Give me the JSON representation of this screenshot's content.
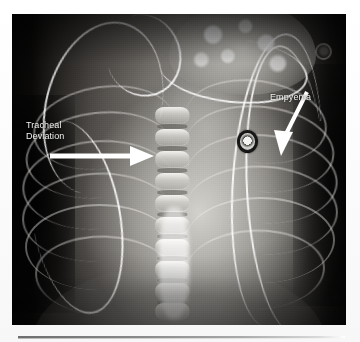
{
  "document": {
    "type": "scanned-figure-page",
    "background_color": "#fdfdfd"
  },
  "figure": {
    "name": "chest-radiograph",
    "modality": "X-ray",
    "view": "frontal chest / upper abdomen",
    "panel": {
      "x": 12,
      "y": 14,
      "width": 334,
      "height": 311
    },
    "background_color": "#0a0908"
  },
  "annotations": [
    {
      "id": "tracheal-deviation",
      "label": "Tracheal\nDeviation",
      "text_color": "#f2f2f0",
      "label_position": {
        "x": 14,
        "y": 106
      },
      "arrow": {
        "direction": "right",
        "tail": {
          "x": 50,
          "y": 156
        },
        "tip": {
          "x": 152,
          "y": 156
        },
        "color": "#ffffff"
      }
    },
    {
      "id": "empyema",
      "label": "Empyema",
      "text_color": "#f2f2f0",
      "label_position": {
        "x": 258,
        "y": 78
      },
      "arrow": {
        "direction": "down-left",
        "tail": {
          "x": 307,
          "y": 92
        },
        "tip": {
          "x": 281,
          "y": 150
        },
        "color": "#ffffff"
      }
    }
  ],
  "devices": [
    {
      "name": "ecg-electrode",
      "shape": "ring",
      "x": 232,
      "y": 124
    },
    {
      "name": "corner-marker",
      "shape": "ring",
      "x": 309,
      "y": 35
    },
    {
      "name": "chest-tube-left",
      "shape": "curved-line"
    },
    {
      "name": "catheter-right-a",
      "shape": "vertical-line"
    },
    {
      "name": "catheter-right-b",
      "shape": "vertical-line"
    }
  ],
  "rule": {
    "name": "horizontal-rule",
    "x": 18,
    "y": 336,
    "width": 327,
    "color": "#8a8a8a"
  }
}
